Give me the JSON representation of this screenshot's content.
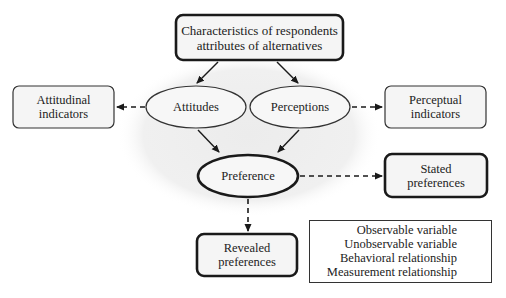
{
  "diagram": {
    "type": "structural-equation-model",
    "colors": {
      "stroke": "#1a1a1a",
      "box_fill": "#f5f5f5",
      "ellipse_fill": "#f7f7f7",
      "background_blob": "#efefef"
    },
    "nodes": {
      "characteristics": {
        "label_line1": "Characteristics of respondents",
        "label_line2": "attributes of alternatives",
        "kind": "observable"
      },
      "attitudinal_indicators": {
        "label_line1": "Attitudinal",
        "label_line2": "indicators",
        "kind": "observable"
      },
      "attitudes": {
        "label": "Attitudes",
        "kind": "unobservable"
      },
      "perceptions": {
        "label": "Perceptions",
        "kind": "unobservable"
      },
      "perceptual_indicators": {
        "label_line1": "Perceptual",
        "label_line2": "indicators",
        "kind": "observable"
      },
      "preference": {
        "label": "Preference",
        "kind": "unobservable"
      },
      "stated_preferences": {
        "label_line1": "Stated",
        "label_line2": "preferences",
        "kind": "observable"
      },
      "revealed_preferences": {
        "label_line1": "Revealed",
        "label_line2": "preferences",
        "kind": "observable"
      }
    },
    "edges": [
      {
        "from": "characteristics",
        "to": "attitudes",
        "type": "behavioral"
      },
      {
        "from": "characteristics",
        "to": "perceptions",
        "type": "behavioral"
      },
      {
        "from": "attitudes",
        "to": "attitudinal_indicators",
        "type": "measurement"
      },
      {
        "from": "perceptions",
        "to": "perceptual_indicators",
        "type": "measurement"
      },
      {
        "from": "attitudes",
        "to": "preference",
        "type": "behavioral"
      },
      {
        "from": "perceptions",
        "to": "preference",
        "type": "behavioral"
      },
      {
        "from": "preference",
        "to": "stated_preferences",
        "type": "measurement"
      },
      {
        "from": "preference",
        "to": "revealed_preferences",
        "type": "measurement"
      }
    ]
  },
  "legend": {
    "items": [
      {
        "label": "Observable variable",
        "symbol": "rounded-rectangle"
      },
      {
        "label": "Unobservable variable",
        "symbol": "ellipse"
      },
      {
        "label": "Behavioral relationship",
        "symbol": "solid-arrow"
      },
      {
        "label": "Measurement relationship",
        "symbol": "dashed-arrow"
      }
    ]
  }
}
